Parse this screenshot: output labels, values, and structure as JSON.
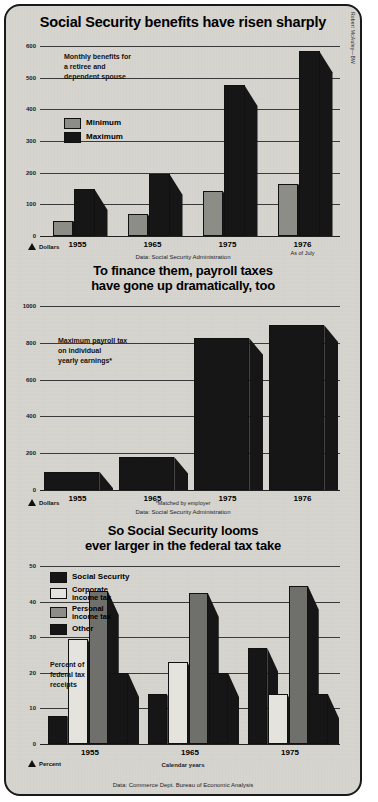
{
  "credit": "Robert McAuley—BW",
  "charts": [
    {
      "id": "benefits",
      "title": "Social Security benefits have risen sharply",
      "note": "Monthly benefits for\na retiree and\ndependent spouse",
      "unit_label": "Dollars",
      "source": "Data: Social Security Administration",
      "legend": [
        {
          "label": "Minimum",
          "color": "#8d8d88"
        },
        {
          "label": "Maximum",
          "color": "#161616"
        }
      ],
      "chart_data": {
        "type": "bar",
        "title": "Social Security benefits have risen sharply",
        "xlabel": "",
        "ylabel": "Dollars",
        "categories": [
          "1955",
          "1965",
          "1975",
          "1976"
        ],
        "category_sublabels": [
          "",
          "",
          "",
          "As of July"
        ],
        "series": [
          {
            "name": "Minimum",
            "values": [
              48,
              68,
              141,
              165
            ]
          },
          {
            "name": "Maximum",
            "values": [
              148,
              196,
              476,
              583
            ]
          }
        ],
        "ylim": [
          0,
          600
        ],
        "yticks": [
          0,
          100,
          200,
          300,
          400,
          500,
          600
        ],
        "grid": true,
        "legend_position": "inside-left",
        "annotation": "Monthly benefits for a retiree and dependent spouse",
        "source": "Data: Social Security Administration"
      }
    },
    {
      "id": "payroll",
      "title": "To finance them, payroll taxes\nhave gone up dramatically, too",
      "note": "Maximum payroll tax\non individual\nyearly earnings*",
      "unit_label": "Dollars",
      "footnote": "*Matched by employer",
      "source": "Data: Social Security Administration",
      "chart_data": {
        "type": "bar",
        "title": "To finance them, payroll taxes have gone up dramatically, too",
        "xlabel": "",
        "ylabel": "Dollars",
        "categories": [
          "1955",
          "1965",
          "1975",
          "1976"
        ],
        "series": [
          {
            "name": "Maximum payroll tax on individual yearly earnings",
            "values": [
              100,
              180,
              825,
              895
            ]
          }
        ],
        "ylim": [
          0,
          1000
        ],
        "yticks": [
          0,
          200,
          400,
          600,
          800,
          1000
        ],
        "grid": true,
        "annotation": "Maximum payroll tax on individual yearly earnings*",
        "footnote": "*Matched by employer",
        "source": "Data: Social Security Administration"
      }
    },
    {
      "id": "taxtake",
      "title": "So Social Security looms\never larger in the federal tax take",
      "note": "Percent of\nfederal tax\nreceipts",
      "unit_label": "Percent",
      "xaxis_title": "Calendar years",
      "source": "Data: Commerce Dept. Bureau of Economic Analysis",
      "legend": [
        {
          "label": "Social Security",
          "color": "#161616"
        },
        {
          "label": "Corporate\nincome tax",
          "color": "#e4e3de"
        },
        {
          "label": "Personal\nincome tax",
          "color": "#8d8d88"
        },
        {
          "label": "Other",
          "color": "#161616"
        }
      ],
      "chart_data": {
        "type": "bar",
        "title": "So Social Security looms ever larger in the federal tax take",
        "xlabel": "Calendar years",
        "ylabel": "Percent",
        "categories": [
          "1955",
          "1965",
          "1975"
        ],
        "series": [
          {
            "name": "Social Security",
            "values": [
              8,
              14,
              27
            ]
          },
          {
            "name": "Corporate income tax",
            "values": [
              29.5,
              23,
              14
            ]
          },
          {
            "name": "Personal income tax",
            "values": [
              43,
              42.5,
              44.5
            ]
          },
          {
            "name": "Other",
            "values": [
              20,
              20,
              14
            ]
          }
        ],
        "ylim": [
          0,
          50
        ],
        "yticks": [
          0,
          10,
          20,
          30,
          40,
          50
        ],
        "grid": true,
        "legend_position": "inside-left",
        "annotation": "Percent of federal tax receipts",
        "source": "Data: Commerce Dept. Bureau of Economic Analysis"
      }
    }
  ]
}
